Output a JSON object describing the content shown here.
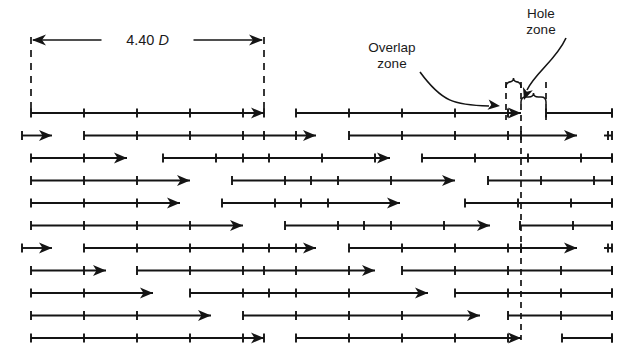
{
  "figure": {
    "type": "engineering-scan-pattern-diagram",
    "background_color": "#ffffff",
    "ink_color": "#141414",
    "width": 638,
    "height": 354
  },
  "dimension": {
    "name": "pitch-dimension",
    "value": "4.40",
    "symbol": "D",
    "label": "4.40 D",
    "arrow_y": 40,
    "left_extension_x": 31,
    "right_extension_x": 264,
    "extension_top": 37,
    "extension_bottom": 115
  },
  "annotations": [
    {
      "id": "overlap",
      "label_line1": "Overlap",
      "label_line2": "zone",
      "text_x": 392,
      "text_y": 52,
      "leader_from": [
        420,
        72
      ],
      "leader_to": [
        500,
        106
      ],
      "brace_x1": 506,
      "brace_x2": 521,
      "brace_y": 88
    },
    {
      "id": "hole",
      "label_line1": "Hole",
      "label_line2": "zone",
      "text_x": 541,
      "text_y": 18,
      "leader_from": [
        566,
        38
      ],
      "leader_to": [
        524,
        100
      ],
      "brace_x1": 521,
      "brace_x2": 546,
      "brace_y": 104
    }
  ],
  "dashed_verticals": [
    {
      "name": "overlap-start-line",
      "x": 506,
      "y1": 82,
      "y2": 120
    },
    {
      "name": "hole-center-line",
      "x": 521,
      "y1": 82,
      "y2": 340
    },
    {
      "name": "hole-end-line",
      "x": 546,
      "y1": 82,
      "y2": 120
    }
  ],
  "chart_data": {
    "type": "line",
    "title": "",
    "xlabel": "",
    "ylabel": "",
    "tick_spacing": 53,
    "row_spacing": 22.5,
    "first_row_y": 113,
    "rows": [
      {
        "index": 0,
        "segments": [
          {
            "x1": 31,
            "x2": 264,
            "arrow": true,
            "ticks": [
              31,
              84,
              137,
              190,
              243,
              264
            ]
          },
          {
            "x1": 296,
            "x2": 521,
            "arrow": true,
            "ticks": [
              296,
              349,
              402,
              455,
              508
            ]
          },
          {
            "x1": 546,
            "x2": 612,
            "arrow": false,
            "ticks": [
              546,
              612
            ]
          }
        ]
      },
      {
        "index": 1,
        "segments": [
          {
            "x1": 22,
            "x2": 52,
            "arrow": true,
            "ticks": [
              22
            ]
          },
          {
            "x1": 84,
            "x2": 316,
            "arrow": true,
            "ticks": [
              84,
              137,
              190,
              243,
              264,
              296
            ]
          },
          {
            "x1": 349,
            "x2": 577,
            "arrow": true,
            "ticks": [
              349,
              402,
              455,
              508,
              521
            ]
          },
          {
            "x1": 604,
            "x2": 612,
            "arrow": false,
            "ticks": [
              608
            ]
          }
        ]
      },
      {
        "index": 2,
        "segments": [
          {
            "x1": 31,
            "x2": 127,
            "arrow": true,
            "ticks": [
              31,
              84
            ]
          },
          {
            "x1": 163,
            "x2": 390,
            "arrow": true,
            "ticks": [
              163,
              216,
              243,
              269,
              322,
              375
            ]
          },
          {
            "x1": 422,
            "x2": 612,
            "arrow": false,
            "ticks": [
              422,
              475,
              528,
              581,
              612
            ]
          }
        ]
      },
      {
        "index": 3,
        "segments": [
          {
            "x1": 31,
            "x2": 190,
            "arrow": true,
            "ticks": [
              31,
              84,
              137
            ]
          },
          {
            "x1": 232,
            "x2": 455,
            "arrow": true,
            "ticks": [
              232,
              285,
              311,
              338,
              391
            ]
          },
          {
            "x1": 488,
            "x2": 612,
            "arrow": false,
            "ticks": [
              488,
              541,
              594,
              612
            ]
          }
        ]
      },
      {
        "index": 4,
        "segments": [
          {
            "x1": 31,
            "x2": 180,
            "arrow": true,
            "ticks": [
              31,
              84,
              137
            ]
          },
          {
            "x1": 222,
            "x2": 400,
            "arrow": true,
            "ticks": [
              222,
              275,
              301,
              328
            ]
          },
          {
            "x1": 465,
            "x2": 612,
            "arrow": false,
            "ticks": [
              465,
              518,
              571,
              612
            ]
          }
        ]
      },
      {
        "index": 5,
        "segments": [
          {
            "x1": 31,
            "x2": 243,
            "arrow": true,
            "ticks": [
              31,
              84,
              137,
              190
            ]
          },
          {
            "x1": 285,
            "x2": 490,
            "arrow": true,
            "ticks": [
              285,
              338,
              364,
              391,
              444
            ]
          },
          {
            "x1": 520,
            "x2": 612,
            "arrow": false,
            "ticks": [
              520,
              573,
              612
            ]
          }
        ]
      },
      {
        "index": 6,
        "segments": [
          {
            "x1": 22,
            "x2": 52,
            "arrow": true,
            "ticks": [
              22
            ]
          },
          {
            "x1": 84,
            "x2": 316,
            "arrow": true,
            "ticks": [
              84,
              137,
              190,
              243,
              269,
              296
            ]
          },
          {
            "x1": 349,
            "x2": 577,
            "arrow": true,
            "ticks": [
              349,
              402,
              455,
              508,
              521
            ]
          },
          {
            "x1": 604,
            "x2": 612,
            "arrow": false,
            "ticks": [
              608
            ]
          }
        ]
      },
      {
        "index": 7,
        "segments": [
          {
            "x1": 31,
            "x2": 106,
            "arrow": true,
            "ticks": [
              31,
              84
            ]
          },
          {
            "x1": 137,
            "x2": 375,
            "arrow": true,
            "ticks": [
              137,
              190,
              243,
              264,
              296,
              349
            ]
          },
          {
            "x1": 402,
            "x2": 612,
            "arrow": false,
            "ticks": [
              402,
              455,
              508,
              561,
              612
            ]
          }
        ]
      },
      {
        "index": 8,
        "segments": [
          {
            "x1": 31,
            "x2": 153,
            "arrow": true,
            "ticks": [
              31,
              84
            ]
          },
          {
            "x1": 190,
            "x2": 428,
            "arrow": true,
            "ticks": [
              190,
              243,
              269,
              296,
              349
            ]
          },
          {
            "x1": 455,
            "x2": 612,
            "arrow": false,
            "ticks": [
              455,
              508,
              561,
              612
            ]
          }
        ]
      },
      {
        "index": 9,
        "segments": [
          {
            "x1": 31,
            "x2": 211,
            "arrow": true,
            "ticks": [
              31,
              84,
              137
            ]
          },
          {
            "x1": 243,
            "x2": 480,
            "arrow": true,
            "ticks": [
              243,
              296,
              349,
              402
            ]
          },
          {
            "x1": 508,
            "x2": 612,
            "arrow": false,
            "ticks": [
              508,
              561,
              612
            ]
          }
        ]
      },
      {
        "index": 10,
        "segments": [
          {
            "x1": 31,
            "x2": 264,
            "arrow": true,
            "ticks": [
              31,
              84,
              137,
              190,
              243,
              264
            ]
          },
          {
            "x1": 296,
            "x2": 521,
            "arrow": true,
            "ticks": [
              296,
              349,
              402,
              455,
              508
            ]
          },
          {
            "x1": 562,
            "x2": 612,
            "arrow": false,
            "ticks": [
              562,
              612
            ]
          }
        ]
      }
    ]
  }
}
